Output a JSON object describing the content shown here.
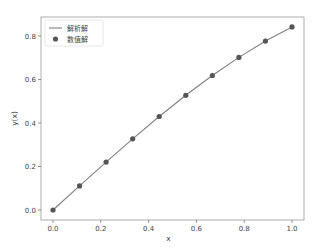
{
  "chart_data": {
    "type": "line",
    "title": "",
    "xlabel": "x",
    "ylabel": "y(x)",
    "xlim": [
      -0.05,
      1.05
    ],
    "ylim": [
      -0.042,
      0.883
    ],
    "xticks": [
      0.0,
      0.2,
      0.4,
      0.6,
      0.8,
      1.0
    ],
    "xtick_labels": [
      "0.0",
      "0.2",
      "0.4",
      "0.6",
      "0.8",
      "1.0"
    ],
    "yticks": [
      0.0,
      0.2,
      0.4,
      0.6,
      0.8
    ],
    "ytick_labels": [
      "0.0",
      "0.2",
      "0.4",
      "0.6",
      "0.8"
    ],
    "grid": false,
    "legend_position": "upper left",
    "series": [
      {
        "name": "解析解",
        "kind": "line",
        "color": "#808080",
        "x": [
          0.0,
          0.1111,
          0.2222,
          0.3333,
          0.4444,
          0.5556,
          0.6667,
          0.7778,
          0.8889,
          1.0
        ],
        "y": [
          0.0,
          0.1109,
          0.2204,
          0.3272,
          0.43,
          0.5274,
          0.6184,
          0.7017,
          0.7766,
          0.8415
        ]
      },
      {
        "name": "数值解",
        "kind": "scatter",
        "color": "#555555",
        "x": [
          0.0,
          0.1111,
          0.2222,
          0.3333,
          0.4444,
          0.5556,
          0.6667,
          0.7778,
          0.8889,
          1.0
        ],
        "y": [
          0.0,
          0.1109,
          0.2204,
          0.3272,
          0.43,
          0.5274,
          0.6184,
          0.7017,
          0.7766,
          0.8415
        ]
      }
    ]
  },
  "legend": {
    "items": [
      {
        "label": "解析解",
        "marker": "line"
      },
      {
        "label": "数值解",
        "marker": "dot"
      }
    ]
  },
  "axes": {
    "xlabel": "x",
    "ylabel": "y(x)"
  }
}
